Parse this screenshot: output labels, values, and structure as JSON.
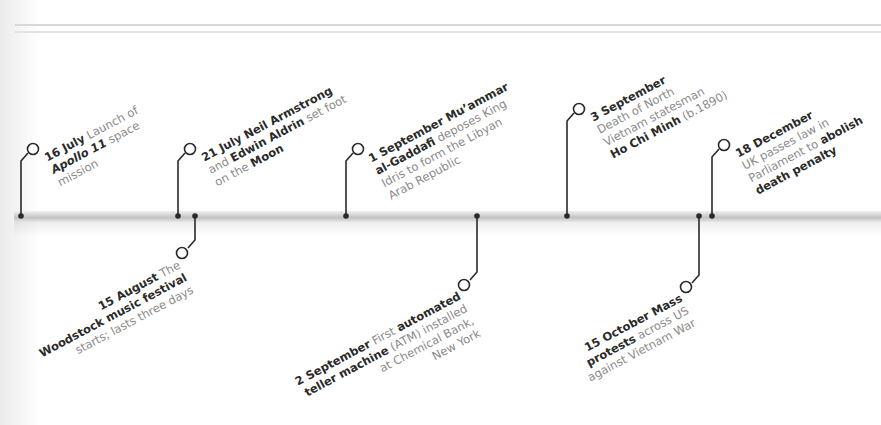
{
  "timeline": {
    "bar_color": "#c8c8c8",
    "line_color": "#2a2a2a",
    "text_color": "#8a8a8a",
    "bold_color": "#2a2a2a",
    "events_above": [
      {
        "date": "16 July",
        "lines": [
          {
            "parts": [
              {
                "t": "16 July",
                "s": "b"
              },
              {
                "t": " Launch of",
                "s": "n"
              }
            ]
          },
          {
            "parts": [
              {
                "t": "Apollo 11",
                "s": "i"
              },
              {
                "t": " space",
                "s": "n"
              }
            ]
          },
          {
            "parts": [
              {
                "t": "mission",
                "s": "n"
              }
            ]
          }
        ]
      },
      {
        "date": "21 July",
        "lines": [
          {
            "parts": [
              {
                "t": "21 July Neil Armstrong",
                "s": "b"
              }
            ]
          },
          {
            "parts": [
              {
                "t": "and ",
                "s": "n"
              },
              {
                "t": "Edwin Aldrin",
                "s": "b"
              },
              {
                "t": " set foot",
                "s": "n"
              }
            ]
          },
          {
            "parts": [
              {
                "t": "on the ",
                "s": "n"
              },
              {
                "t": "Moon",
                "s": "b"
              }
            ]
          }
        ]
      },
      {
        "date": "1 September",
        "lines": [
          {
            "parts": [
              {
                "t": "1 September Mu’ammar",
                "s": "b"
              }
            ]
          },
          {
            "parts": [
              {
                "t": "al-Gaddafi",
                "s": "b"
              },
              {
                "t": " deposes King",
                "s": "n"
              }
            ]
          },
          {
            "parts": [
              {
                "t": "Idris to form the Libyan",
                "s": "n"
              }
            ]
          },
          {
            "parts": [
              {
                "t": "Arab Republic",
                "s": "n"
              }
            ]
          }
        ]
      },
      {
        "date": "3 September",
        "lines": [
          {
            "parts": [
              {
                "t": "3 September",
                "s": "b"
              }
            ]
          },
          {
            "parts": [
              {
                "t": "Death of North",
                "s": "n"
              }
            ]
          },
          {
            "parts": [
              {
                "t": "Vietnam statesman",
                "s": "n"
              }
            ]
          },
          {
            "parts": [
              {
                "t": "Ho Chi Minh",
                "s": "b"
              },
              {
                "t": " (b.1890)",
                "s": "n"
              }
            ]
          }
        ]
      },
      {
        "date": "18 December",
        "lines": [
          {
            "parts": [
              {
                "t": "18 December",
                "s": "b"
              }
            ]
          },
          {
            "parts": [
              {
                "t": "UK passes law in",
                "s": "n"
              }
            ]
          },
          {
            "parts": [
              {
                "t": "Parliament to ",
                "s": "n"
              },
              {
                "t": "abolish",
                "s": "b"
              }
            ]
          },
          {
            "parts": [
              {
                "t": "death penalty",
                "s": "b"
              }
            ]
          }
        ]
      }
    ],
    "events_below": [
      {
        "date": "15 August",
        "lines": [
          {
            "parts": [
              {
                "t": "15 August",
                "s": "b"
              },
              {
                "t": " The",
                "s": "n"
              }
            ]
          },
          {
            "parts": [
              {
                "t": "Woodstock music festival",
                "s": "b"
              }
            ]
          },
          {
            "parts": [
              {
                "t": "starts; lasts three days",
                "s": "n"
              }
            ]
          }
        ]
      },
      {
        "date": "2 September",
        "lines": [
          {
            "parts": [
              {
                "t": "2 September",
                "s": "b"
              },
              {
                "t": " First ",
                "s": "n"
              },
              {
                "t": "automated",
                "s": "b"
              }
            ]
          },
          {
            "parts": [
              {
                "t": "teller machine",
                "s": "b"
              },
              {
                "t": " (ATM) installed",
                "s": "n"
              }
            ]
          },
          {
            "parts": [
              {
                "t": "at Chemical Bank,",
                "s": "n"
              }
            ]
          },
          {
            "parts": [
              {
                "t": "New York",
                "s": "n"
              }
            ]
          }
        ]
      },
      {
        "date": "15 October",
        "lines": [
          {
            "parts": [
              {
                "t": "15 October Mass",
                "s": "b"
              }
            ]
          },
          {
            "parts": [
              {
                "t": "protests",
                "s": "b"
              },
              {
                "t": " across US",
                "s": "n"
              }
            ]
          },
          {
            "parts": [
              {
                "t": "against Vietnam War",
                "s": "n"
              }
            ]
          }
        ]
      }
    ]
  }
}
